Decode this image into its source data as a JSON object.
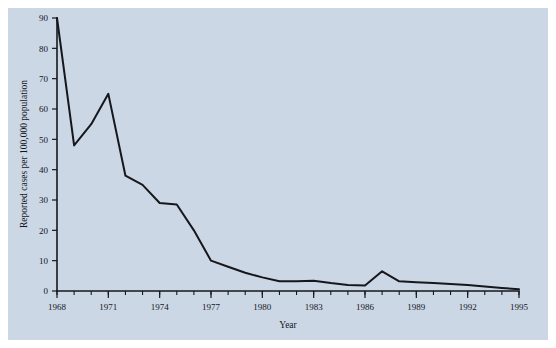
{
  "figure": {
    "background_color": "#ccd7e6",
    "page_color": "#ffffff",
    "line_color": "#15171c",
    "axis_color": "#15171c"
  },
  "chart_data": {
    "type": "line",
    "title": "",
    "subtitle": "",
    "xlabel": "Year",
    "ylabel": "Reported cases per 100,000 population",
    "xlim": [
      1968,
      1995
    ],
    "ylim": [
      0,
      90
    ],
    "grid": false,
    "legend": null,
    "legend_position": "none",
    "x_major_tick_labels": [
      "1968",
      "1971",
      "1974",
      "1977",
      "1980",
      "1983",
      "1986",
      "1989",
      "1992",
      "1995"
    ],
    "x_major_ticks": [
      1968,
      1971,
      1974,
      1977,
      1980,
      1983,
      1986,
      1989,
      1992,
      1995
    ],
    "x_minor_tick_interval": 1,
    "y_ticks": [
      0,
      10,
      20,
      30,
      40,
      50,
      60,
      70,
      80,
      90
    ],
    "y_tick_labels": [
      "0",
      "10",
      "20",
      "30",
      "40",
      "50",
      "60",
      "70",
      "80",
      "90"
    ],
    "x": [
      1968,
      1969,
      1970,
      1971,
      1972,
      1973,
      1974,
      1975,
      1976,
      1977,
      1978,
      1979,
      1980,
      1981,
      1982,
      1983,
      1984,
      1985,
      1986,
      1987,
      1988,
      1989,
      1990,
      1991,
      1992,
      1993,
      1994,
      1995
    ],
    "values": [
      90,
      48,
      55,
      65,
      38,
      35,
      29,
      28.5,
      20,
      10,
      8,
      6,
      4.5,
      3.2,
      3.2,
      3.4,
      2.6,
      2.0,
      1.8,
      6.5,
      3.2,
      2.9,
      2.6,
      2.3,
      2.0,
      1.5,
      1.0,
      0.6
    ],
    "series": [
      {
        "name": "Reported cases per 100,000 population",
        "values": [
          90,
          48,
          55,
          65,
          38,
          35,
          29,
          28.5,
          20,
          10,
          8,
          6,
          4.5,
          3.2,
          3.2,
          3.4,
          2.6,
          2.0,
          1.8,
          6.5,
          3.2,
          2.9,
          2.6,
          2.3,
          2.0,
          1.5,
          1.0,
          0.6
        ]
      }
    ]
  }
}
